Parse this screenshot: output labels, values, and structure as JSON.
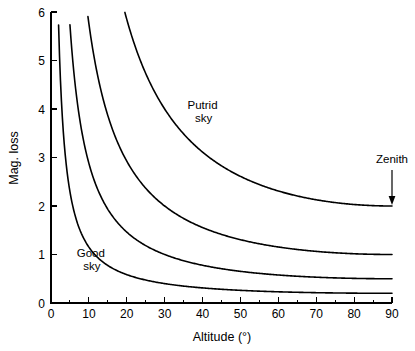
{
  "chart_data": {
    "type": "line",
    "title": "",
    "xlabel": "Altitude (°)",
    "ylabel": "Mag. loss",
    "xlim": [
      0,
      90
    ],
    "ylim": [
      0,
      6
    ],
    "grid": false,
    "legend_position": "none",
    "x_ticks": [
      0,
      10,
      20,
      30,
      40,
      50,
      60,
      70,
      80,
      90
    ],
    "x_tick_labels": [
      "0",
      "10",
      "20",
      "30",
      "40",
      "50",
      "60",
      "70",
      "80",
      "90"
    ],
    "x_minor_tick_step": 5,
    "y_ticks": [
      0,
      1,
      2,
      3,
      4,
      5,
      6
    ],
    "y_tick_labels": [
      "0",
      "1",
      "2",
      "3",
      "4",
      "5",
      "6"
    ],
    "formula": "mag_loss = k / sin(altitude)",
    "series": [
      {
        "name": "Putrid sky",
        "k": 2.0,
        "zenith_value": 2.0,
        "x": [
          2,
          3,
          4,
          5,
          6,
          7,
          8,
          9,
          10,
          12,
          14,
          16,
          18,
          20,
          25,
          30,
          35,
          40,
          45,
          50,
          55,
          60,
          65,
          70,
          75,
          80,
          85,
          90
        ],
        "values": [
          57.3,
          38.2,
          28.7,
          22.9,
          19.1,
          16.4,
          14.4,
          12.8,
          11.5,
          9.6,
          8.3,
          7.3,
          6.5,
          5.8,
          4.7,
          4.0,
          3.5,
          3.1,
          2.8,
          2.6,
          2.4,
          2.3,
          2.2,
          2.1,
          2.1,
          2.0,
          2.0,
          2.0
        ]
      },
      {
        "name": "curve-k1",
        "k": 1.0,
        "zenith_value": 1.0,
        "x": [
          2,
          3,
          4,
          5,
          6,
          7,
          8,
          9,
          10,
          12,
          14,
          16,
          18,
          20,
          25,
          30,
          35,
          40,
          45,
          50,
          55,
          60,
          65,
          70,
          75,
          80,
          85,
          90
        ],
        "values": [
          28.7,
          19.1,
          14.3,
          11.5,
          9.6,
          8.2,
          7.2,
          6.4,
          5.8,
          4.8,
          4.1,
          3.6,
          3.2,
          2.9,
          2.4,
          2.0,
          1.7,
          1.6,
          1.4,
          1.3,
          1.2,
          1.2,
          1.1,
          1.1,
          1.0,
          1.0,
          1.0,
          1.0
        ]
      },
      {
        "name": "curve-k05",
        "k": 0.5,
        "zenith_value": 0.5,
        "x": [
          2,
          3,
          4,
          5,
          6,
          7,
          8,
          9,
          10,
          12,
          14,
          16,
          18,
          20,
          25,
          30,
          35,
          40,
          45,
          50,
          55,
          60,
          65,
          70,
          75,
          80,
          85,
          90
        ],
        "values": [
          14.3,
          9.6,
          7.2,
          5.7,
          4.8,
          4.1,
          3.6,
          3.2,
          2.9,
          2.4,
          2.1,
          1.8,
          1.6,
          1.5,
          1.2,
          1.0,
          0.87,
          0.78,
          0.71,
          0.65,
          0.61,
          0.58,
          0.55,
          0.53,
          0.52,
          0.51,
          0.5,
          0.5
        ]
      },
      {
        "name": "Good sky",
        "k": 0.2,
        "zenith_value": 0.2,
        "x": [
          2,
          3,
          4,
          5,
          6,
          7,
          8,
          9,
          10,
          12,
          14,
          16,
          18,
          20,
          25,
          30,
          35,
          40,
          45,
          50,
          55,
          60,
          65,
          70,
          75,
          80,
          85,
          90
        ],
        "values": [
          5.7,
          3.8,
          2.9,
          2.3,
          1.9,
          1.6,
          1.4,
          1.3,
          1.2,
          0.96,
          0.83,
          0.73,
          0.65,
          0.58,
          0.47,
          0.4,
          0.35,
          0.31,
          0.28,
          0.26,
          0.24,
          0.23,
          0.22,
          0.21,
          0.21,
          0.2,
          0.2,
          0.2
        ]
      }
    ],
    "annotations": [
      {
        "id": "putrid",
        "text_line1": "Putrid",
        "text_line2": "sky",
        "x": 40,
        "y": 4.0
      },
      {
        "id": "good",
        "text_line1": "Good",
        "text_line2": "sky",
        "x": 10.5,
        "y": 0.95
      },
      {
        "id": "zenith",
        "text_line1": "Zenith",
        "x": 90,
        "y": 2.0
      }
    ]
  },
  "colors": {
    "background": "#ffffff",
    "axis": "#000000",
    "curve": "#000000",
    "text": "#000000"
  }
}
